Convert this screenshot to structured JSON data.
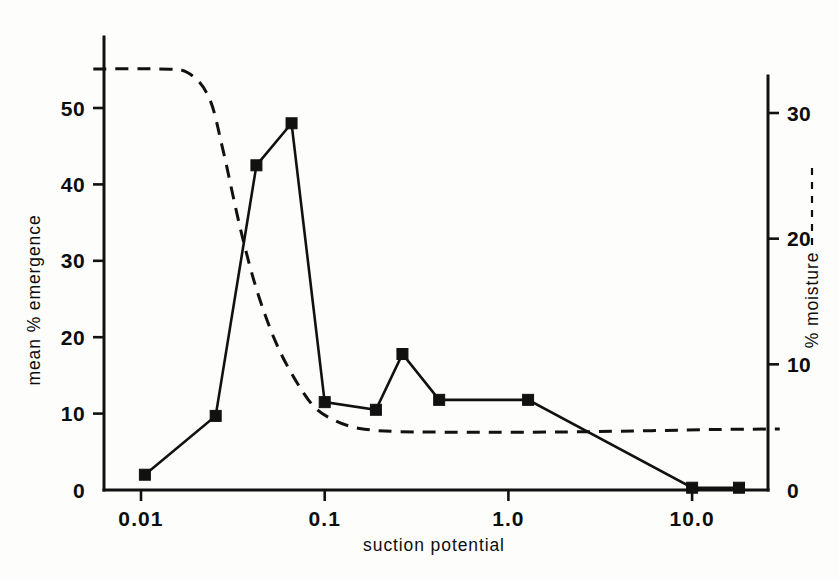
{
  "chart_data": {
    "type": "line",
    "title": "",
    "xlabel": "suction potential",
    "xscale": "log",
    "xlim": [
      0.0055,
      0.035
    ],
    "x_ticks": [
      {
        "value": 0.01,
        "label": "0.01"
      },
      {
        "value": 0.1,
        "label": "0.1"
      },
      {
        "value": 1.0,
        "label": "1.0"
      },
      {
        "value": 10.0,
        "label": "10.0"
      }
    ],
    "left_axis": {
      "label": "mean % emergence",
      "ticks": [
        {
          "value": 0,
          "label": "0"
        },
        {
          "value": 10,
          "label": "10"
        },
        {
          "value": 20,
          "label": "20"
        },
        {
          "value": 30,
          "label": "30"
        },
        {
          "value": 40,
          "label": "40"
        },
        {
          "value": 50,
          "label": "50"
        }
      ],
      "ylim": [
        0,
        59.5
      ]
    },
    "right_axis": {
      "label": "% moisture",
      "legend_style": "dashed",
      "ticks": [
        {
          "value": 0,
          "label": "0"
        },
        {
          "value": 10,
          "label": "10"
        },
        {
          "value": 20,
          "label": "20"
        },
        {
          "value": 30,
          "label": "30"
        }
      ],
      "ylim": [
        0,
        36.5
      ]
    },
    "grid": false,
    "legend_position": "right-axis-label",
    "series": [
      {
        "name": "mean % emergence",
        "axis": "left",
        "style": "solid",
        "marker": "filled-square",
        "points": [
          {
            "x": 0.0105,
            "y": 2.0
          },
          {
            "x": 0.0255,
            "y": 9.7
          },
          {
            "x": 0.0425,
            "y": 42.5
          },
          {
            "x": 0.066,
            "y": 48.0
          },
          {
            "x": 0.1,
            "y": 11.5
          },
          {
            "x": 0.19,
            "y": 10.5
          },
          {
            "x": 0.265,
            "y": 17.8
          },
          {
            "x": 0.42,
            "y": 11.8
          },
          {
            "x": 1.28,
            "y": 11.8
          },
          {
            "x": 10.0,
            "y": 0.3
          },
          {
            "x": 18.0,
            "y": 0.3
          }
        ]
      },
      {
        "name": "% moisture",
        "axis": "right",
        "style": "dashed",
        "marker": "none",
        "points": [
          {
            "x": 0.0055,
            "y": 33.5
          },
          {
            "x": 0.0125,
            "y": 33.5
          },
          {
            "x": 0.018,
            "y": 33.2
          },
          {
            "x": 0.0235,
            "y": 31.2
          },
          {
            "x": 0.028,
            "y": 27.0
          },
          {
            "x": 0.0345,
            "y": 21.0
          },
          {
            "x": 0.0425,
            "y": 16.0
          },
          {
            "x": 0.054,
            "y": 11.8
          },
          {
            "x": 0.069,
            "y": 8.8
          },
          {
            "x": 0.088,
            "y": 6.6
          },
          {
            "x": 0.115,
            "y": 5.5
          },
          {
            "x": 0.155,
            "y": 4.9
          },
          {
            "x": 0.25,
            "y": 4.65
          },
          {
            "x": 0.6,
            "y": 4.6
          },
          {
            "x": 2.0,
            "y": 4.62
          },
          {
            "x": 6.0,
            "y": 4.72
          },
          {
            "x": 14.0,
            "y": 4.82
          },
          {
            "x": 30.0,
            "y": 4.85
          }
        ]
      }
    ]
  }
}
